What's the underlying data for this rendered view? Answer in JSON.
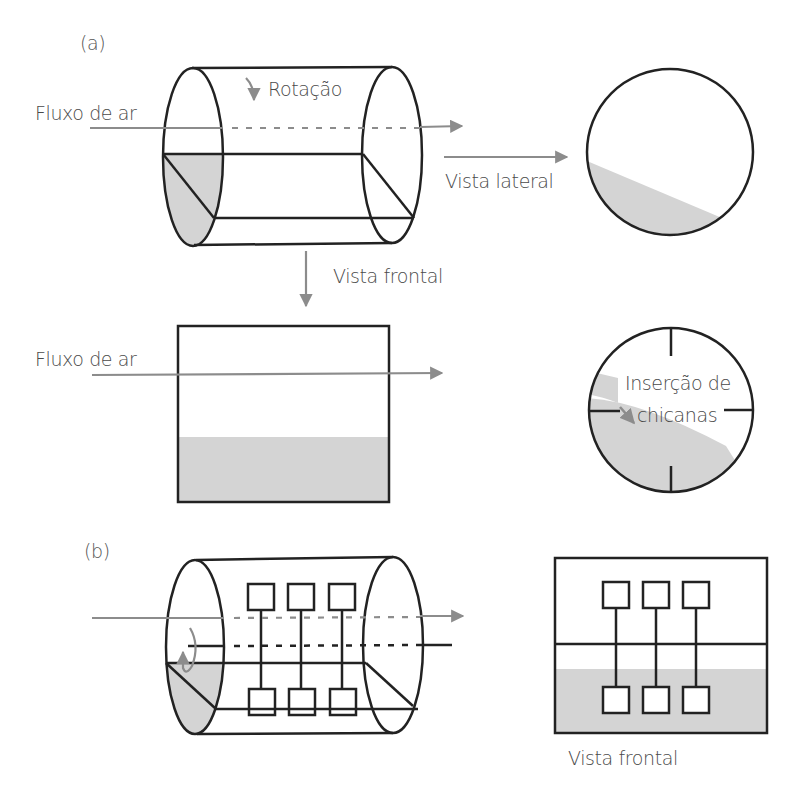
{
  "panels": {
    "a": {
      "label": "(a)",
      "rotation_label": "Rotação",
      "airflow_label": "Fluxo de ar",
      "side_view_label": "Vista lateral",
      "front_view_label": "Vista frontal",
      "front_airflow_label": "Fluxo de ar",
      "baffles_label_line1": "Inserção de",
      "baffles_label_line2": "chicanas"
    },
    "b": {
      "label": "(b)",
      "front_view_label": "Vista frontal"
    }
  },
  "colors": {
    "stroke": "#222222",
    "arrow": "#8c8c8c",
    "fill": "#d4d4d4",
    "text": "#4a4a4a"
  }
}
